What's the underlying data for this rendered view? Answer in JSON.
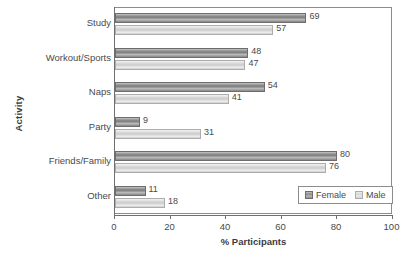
{
  "chart_data": {
    "type": "bar",
    "orientation": "horizontal",
    "title": "",
    "xlabel": "% Participants",
    "ylabel": "Activity",
    "xlim": [
      0,
      100
    ],
    "xticks": [
      0,
      20,
      40,
      60,
      80,
      100
    ],
    "xtick_labels": [
      "0",
      "20",
      "40",
      "60",
      "80",
      "100"
    ],
    "grid": false,
    "legend_position": "bottom-right",
    "categories": [
      "Study",
      "Workout/Sports",
      "Naps",
      "Party",
      "Friends/Family",
      "Other"
    ],
    "series": [
      {
        "name": "Female",
        "color": "#8a8a8a",
        "values": [
          69,
          48,
          54,
          9,
          80,
          11
        ],
        "value_labels": [
          "69",
          "48",
          "54",
          "9",
          "80",
          "11"
        ]
      },
      {
        "name": "Male",
        "color": "#d8d8d8",
        "values": [
          57,
          47,
          41,
          31,
          76,
          18
        ],
        "value_labels": [
          "57",
          "47",
          "41",
          "31",
          "76",
          "18"
        ]
      }
    ]
  },
  "axes": {
    "y_title": "Activity",
    "x_title": "% Participants"
  },
  "legend": {
    "items": [
      {
        "label": "Female",
        "swatch": "female-swatch"
      },
      {
        "label": "Male",
        "swatch": "male-swatch"
      }
    ]
  },
  "colors": {
    "female_bar": "#8a8a8a",
    "male_bar": "#d8d8d8",
    "axis": "#6f6f6f",
    "text": "#4a4a4a",
    "background": "#ffffff"
  }
}
